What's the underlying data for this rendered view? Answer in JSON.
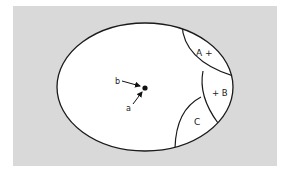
{
  "diagram": {
    "type": "ellipse-region-diagram",
    "background_color": "#d9d9d9",
    "regions": [
      {
        "id": "A",
        "label": "A +"
      },
      {
        "id": "B",
        "label": "+ B"
      },
      {
        "id": "C",
        "label": "C"
      }
    ],
    "center_point": {
      "arrows": [
        {
          "label": "b"
        },
        {
          "label": "a"
        }
      ]
    }
  }
}
